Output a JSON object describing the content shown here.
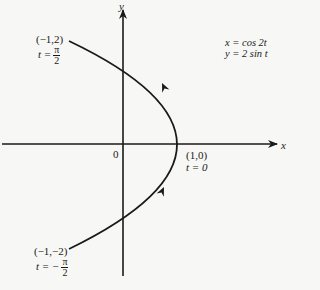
{
  "axes": {
    "x_label": "x",
    "y_label": "y",
    "origin_label": "0"
  },
  "equations": {
    "line1": "x = cos 2t",
    "line2": "y = 2 sin t"
  },
  "points": {
    "top": {
      "coord": "(−1,2)",
      "t_prefix": "t =",
      "t_num": "π",
      "t_den": "2"
    },
    "vertex": {
      "coord": "(1,0)",
      "t_text": "t = 0"
    },
    "bottom": {
      "coord": "(−1,−2)",
      "t_prefix": "t = −",
      "t_num": "π",
      "t_den": "2"
    }
  },
  "curve": {
    "description": "Parametric curve x = cos 2t, y = 2 sin t for t from −π/2 to π/2 (parabola x = 1 − y²/2), traversed upward",
    "direction_arrows": 2
  }
}
